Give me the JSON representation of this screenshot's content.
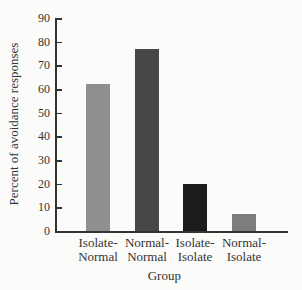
{
  "chart_data": {
    "type": "bar",
    "title": "",
    "xlabel": "Group",
    "ylabel": "Percent of avoidance responses",
    "ylim": [
      0,
      90
    ],
    "yticks": [
      0,
      10,
      20,
      30,
      40,
      50,
      60,
      70,
      80,
      90
    ],
    "grid": false,
    "categories": [
      "Isolate-\nNormal",
      "Normal-\nNormal",
      "Isolate-\nIsolate",
      "Normal-\nIsolate"
    ],
    "category_lines": [
      [
        "Isolate-",
        "Normal"
      ],
      [
        "Normal-",
        "Normal"
      ],
      [
        "Isolate-",
        "Isolate"
      ],
      [
        "Normal-",
        "Isolate"
      ]
    ],
    "values": [
      62,
      77,
      20,
      7
    ],
    "colors": [
      "#8f8f8f",
      "#474747",
      "#1c1c1c",
      "#7d7d7d"
    ]
  }
}
